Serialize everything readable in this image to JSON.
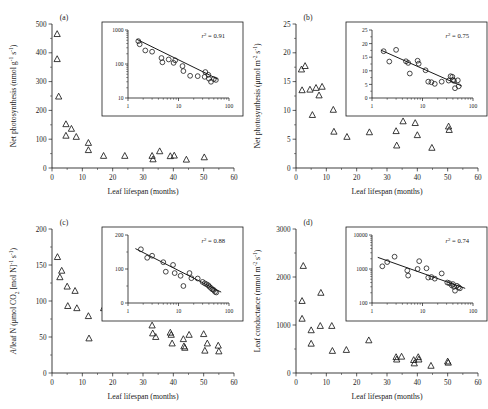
{
  "figure": {
    "shared_xlabel": "Leaf lifespan (months)",
    "xlim": [
      0,
      60
    ],
    "xticks": [
      0,
      10,
      20,
      30,
      40,
      50,
      60
    ]
  },
  "chart_data": [
    {
      "type": "scatter",
      "panel": "(a)",
      "title": "",
      "xlabel": "Leaf lifespan (months)",
      "ylabel": "Net photosynthesis (nmol g⁻¹ s⁻¹)",
      "ylabel_parts": {
        "base": "Net photosynthesis (nmol g",
        "sup1": "-1",
        "mid": " s",
        "sup2": "-1",
        "tail": ")"
      },
      "xlim": [
        0,
        60
      ],
      "ylim": [
        0,
        500
      ],
      "xticks": [
        0,
        10,
        20,
        30,
        40,
        50,
        60
      ],
      "yticks": [
        0,
        100,
        200,
        300,
        400,
        500
      ],
      "grid": false,
      "marker": "open-triangle",
      "points": [
        {
          "x": 1.7,
          "y": 465
        },
        {
          "x": 1.7,
          "y": 378
        },
        {
          "x": 2.2,
          "y": 248
        },
        {
          "x": 4.6,
          "y": 152
        },
        {
          "x": 4.6,
          "y": 112
        },
        {
          "x": 6.4,
          "y": 136
        },
        {
          "x": 8.0,
          "y": 108
        },
        {
          "x": 12.0,
          "y": 87
        },
        {
          "x": 12.0,
          "y": 62
        },
        {
          "x": 17.0,
          "y": 42
        },
        {
          "x": 24.0,
          "y": 42
        },
        {
          "x": 33.0,
          "y": 42
        },
        {
          "x": 33.3,
          "y": 30
        },
        {
          "x": 35.5,
          "y": 58
        },
        {
          "x": 39.0,
          "y": 41
        },
        {
          "x": 40.3,
          "y": 43
        },
        {
          "x": 44.3,
          "y": 29
        },
        {
          "x": 50.2,
          "y": 37
        }
      ],
      "inset": {
        "r2_label": "r² = 0.91",
        "r2_value": 0.91,
        "xscale": "log",
        "yscale": "log",
        "xlim": [
          1,
          100
        ],
        "ylim": [
          10,
          1000
        ],
        "xticks": [
          1,
          10,
          100
        ],
        "yticks": [
          10,
          100,
          1000
        ],
        "marker": "open-circle",
        "fit_line": {
          "x1": 1.5,
          "y1": 530,
          "x2": 60,
          "y2": 36
        },
        "points": [
          {
            "x": 1.6,
            "y": 470
          },
          {
            "x": 1.7,
            "y": 380
          },
          {
            "x": 2.2,
            "y": 250
          },
          {
            "x": 3.0,
            "y": 230
          },
          {
            "x": 4.6,
            "y": 150
          },
          {
            "x": 4.8,
            "y": 112
          },
          {
            "x": 6.4,
            "y": 136
          },
          {
            "x": 8.0,
            "y": 108
          },
          {
            "x": 8.6,
            "y": 128
          },
          {
            "x": 12.0,
            "y": 87
          },
          {
            "x": 12.5,
            "y": 62
          },
          {
            "x": 17.0,
            "y": 45
          },
          {
            "x": 24.0,
            "y": 44
          },
          {
            "x": 33.0,
            "y": 42
          },
          {
            "x": 34.0,
            "y": 58
          },
          {
            "x": 39.0,
            "y": 48
          },
          {
            "x": 40.0,
            "y": 37
          },
          {
            "x": 44.0,
            "y": 30
          },
          {
            "x": 50.0,
            "y": 36
          },
          {
            "x": 55.0,
            "y": 34
          }
        ]
      }
    },
    {
      "type": "scatter",
      "panel": "(b)",
      "title": "",
      "xlabel": "Leaf lifespan (months)",
      "ylabel": "Net photosynthesis (μmol m⁻² s⁻¹)",
      "ylabel_parts": {
        "base": "Net photosynthesis (μmol m",
        "sup1": "-2",
        "mid": " s",
        "sup2": "-1",
        "tail": ")"
      },
      "xlim": [
        0,
        60
      ],
      "ylim": [
        0,
        25
      ],
      "xticks": [
        0,
        10,
        20,
        30,
        40,
        50,
        60
      ],
      "yticks": [
        0,
        5,
        10,
        15,
        20,
        25
      ],
      "grid": false,
      "marker": "open-triangle",
      "points": [
        {
          "x": 1.8,
          "y": 17.1
        },
        {
          "x": 2.0,
          "y": 13.5
        },
        {
          "x": 3.0,
          "y": 17.7
        },
        {
          "x": 4.6,
          "y": 13.6
        },
        {
          "x": 5.4,
          "y": 9.2
        },
        {
          "x": 6.6,
          "y": 13.9
        },
        {
          "x": 7.6,
          "y": 12.6
        },
        {
          "x": 8.6,
          "y": 14.1
        },
        {
          "x": 12.3,
          "y": 10.1
        },
        {
          "x": 12.5,
          "y": 6.3
        },
        {
          "x": 16.8,
          "y": 5.4
        },
        {
          "x": 24.2,
          "y": 6.2
        },
        {
          "x": 33.0,
          "y": 6.4
        },
        {
          "x": 33.2,
          "y": 3.9
        },
        {
          "x": 35.3,
          "y": 8.1
        },
        {
          "x": 39.3,
          "y": 7.8
        },
        {
          "x": 40.0,
          "y": 5.7
        },
        {
          "x": 44.8,
          "y": 3.5
        },
        {
          "x": 50.3,
          "y": 7.2
        },
        {
          "x": 50.5,
          "y": 6.6
        }
      ],
      "inset": {
        "r2_label": "r² = 0.75",
        "r2_value": 0.75,
        "xscale": "log",
        "yscale": "linear",
        "xlim": [
          1,
          100
        ],
        "ylim": [
          0,
          25
        ],
        "xticks": [
          1,
          10,
          100
        ],
        "yticks": [
          0,
          5,
          10,
          15,
          20,
          25
        ],
        "marker": "open-circle",
        "fit_line": {
          "x1": 1.5,
          "y1": 17.6,
          "x2": 60,
          "y2": 4.4
        },
        "points": [
          {
            "x": 1.7,
            "y": 17.2
          },
          {
            "x": 2.2,
            "y": 13.4
          },
          {
            "x": 3.0,
            "y": 17.7
          },
          {
            "x": 4.7,
            "y": 13.5
          },
          {
            "x": 5.2,
            "y": 12.9
          },
          {
            "x": 5.6,
            "y": 9.0
          },
          {
            "x": 8.0,
            "y": 13.7
          },
          {
            "x": 8.4,
            "y": 12.6
          },
          {
            "x": 11.5,
            "y": 10.2
          },
          {
            "x": 13.0,
            "y": 6.0
          },
          {
            "x": 15.0,
            "y": 5.8
          },
          {
            "x": 17.5,
            "y": 5.2
          },
          {
            "x": 24.0,
            "y": 6.0
          },
          {
            "x": 33.0,
            "y": 6.4
          },
          {
            "x": 36.0,
            "y": 8.0
          },
          {
            "x": 39.0,
            "y": 7.8
          },
          {
            "x": 40.0,
            "y": 6.6
          },
          {
            "x": 42.0,
            "y": 6.3
          },
          {
            "x": 44.0,
            "y": 3.6
          },
          {
            "x": 50.0,
            "y": 6.5
          },
          {
            "x": 52.0,
            "y": 4.3
          }
        ]
      }
    },
    {
      "type": "scatter",
      "panel": "(c)",
      "title": "",
      "xlabel": "Leaf lifespan (months)",
      "ylabel": "A/leaf N (μmol CO₂ [mol N]⁻¹ s⁻¹)",
      "ylabel_parts": {
        "base": "A/leaf N (μmol CO",
        "sub1": "2",
        "mid": " [mol N]",
        "sup1": "-1",
        "mid2": " s",
        "sup2": "-1",
        "tail": ")"
      },
      "xlim": [
        0,
        60
      ],
      "ylim": [
        0,
        200
      ],
      "xticks": [
        0,
        10,
        20,
        30,
        40,
        50,
        60
      ],
      "yticks": [
        0,
        50,
        100,
        150,
        200
      ],
      "grid": false,
      "marker": "open-triangle",
      "points": [
        {
          "x": 1.8,
          "y": 161
        },
        {
          "x": 2.6,
          "y": 133
        },
        {
          "x": 3.2,
          "y": 142
        },
        {
          "x": 5.0,
          "y": 120
        },
        {
          "x": 5.2,
          "y": 93
        },
        {
          "x": 7.6,
          "y": 114
        },
        {
          "x": 8.2,
          "y": 90
        },
        {
          "x": 12.0,
          "y": 79
        },
        {
          "x": 12.2,
          "y": 48
        },
        {
          "x": 17.0,
          "y": 90
        },
        {
          "x": 33.0,
          "y": 66
        },
        {
          "x": 33.2,
          "y": 55
        },
        {
          "x": 34.2,
          "y": 50
        },
        {
          "x": 39.0,
          "y": 56
        },
        {
          "x": 39.3,
          "y": 53
        },
        {
          "x": 39.6,
          "y": 41
        },
        {
          "x": 43.3,
          "y": 47
        },
        {
          "x": 43.5,
          "y": 37
        },
        {
          "x": 43.8,
          "y": 35
        },
        {
          "x": 45.2,
          "y": 53
        },
        {
          "x": 50.0,
          "y": 54
        },
        {
          "x": 50.4,
          "y": 31
        },
        {
          "x": 51.2,
          "y": 41
        },
        {
          "x": 54.8,
          "y": 38
        },
        {
          "x": 55.0,
          "y": 30
        }
      ],
      "inset": {
        "r2_label": "r² = 0.88",
        "r2_value": 0.88,
        "xscale": "log",
        "yscale": "linear",
        "xlim": [
          1,
          100
        ],
        "ylim": [
          0,
          200
        ],
        "xticks": [
          1,
          10,
          100
        ],
        "yticks": [
          0,
          100,
          200
        ],
        "marker": "open-circle",
        "fit_line": {
          "x1": 1.4,
          "y1": 160,
          "x2": 70,
          "y2": 32
        },
        "points": [
          {
            "x": 1.8,
            "y": 158
          },
          {
            "x": 2.4,
            "y": 133
          },
          {
            "x": 3.0,
            "y": 139
          },
          {
            "x": 5.0,
            "y": 120
          },
          {
            "x": 5.6,
            "y": 92
          },
          {
            "x": 7.8,
            "y": 112
          },
          {
            "x": 8.4,
            "y": 88
          },
          {
            "x": 11.0,
            "y": 80
          },
          {
            "x": 12.5,
            "y": 50
          },
          {
            "x": 16.5,
            "y": 88
          },
          {
            "x": 18.0,
            "y": 73
          },
          {
            "x": 24.0,
            "y": 72
          },
          {
            "x": 30.0,
            "y": 62
          },
          {
            "x": 33.0,
            "y": 58
          },
          {
            "x": 36.0,
            "y": 55
          },
          {
            "x": 39.0,
            "y": 52
          },
          {
            "x": 41.0,
            "y": 48
          },
          {
            "x": 44.0,
            "y": 44
          },
          {
            "x": 47.0,
            "y": 40
          },
          {
            "x": 50.0,
            "y": 38
          },
          {
            "x": 53.0,
            "y": 33
          },
          {
            "x": 56.0,
            "y": 31
          }
        ]
      }
    },
    {
      "type": "scatter",
      "panel": "(d)",
      "title": "",
      "xlabel": "Leaf lifespan (months)",
      "ylabel": "Leaf conductance (mmol m⁻² s⁻¹)",
      "ylabel_parts": {
        "base": "Leaf conductance (mmol m",
        "sup1": "-2",
        "mid": " s",
        "sup2": "-1",
        "tail": ")"
      },
      "xlim": [
        0,
        60
      ],
      "ylim": [
        0,
        3000
      ],
      "xticks": [
        0,
        10,
        20,
        30,
        40,
        50,
        60
      ],
      "yticks": [
        0,
        1000,
        2000,
        3000
      ],
      "grid": false,
      "marker": "open-triangle",
      "points": [
        {
          "x": 2.4,
          "y": 2230
        },
        {
          "x": 2.0,
          "y": 1500
        },
        {
          "x": 2.0,
          "y": 1130
        },
        {
          "x": 5.0,
          "y": 890
        },
        {
          "x": 5.0,
          "y": 610
        },
        {
          "x": 8.2,
          "y": 1670
        },
        {
          "x": 8.0,
          "y": 980
        },
        {
          "x": 11.8,
          "y": 980
        },
        {
          "x": 12.0,
          "y": 460
        },
        {
          "x": 16.6,
          "y": 480
        },
        {
          "x": 24.0,
          "y": 680
        },
        {
          "x": 33.0,
          "y": 330
        },
        {
          "x": 33.2,
          "y": 280
        },
        {
          "x": 34.8,
          "y": 340
        },
        {
          "x": 38.8,
          "y": 270
        },
        {
          "x": 39.0,
          "y": 200
        },
        {
          "x": 40.3,
          "y": 330
        },
        {
          "x": 40.5,
          "y": 280
        },
        {
          "x": 44.5,
          "y": 150
        },
        {
          "x": 50.0,
          "y": 240
        },
        {
          "x": 50.2,
          "y": 215
        }
      ],
      "inset": {
        "r2_label": "r² = 0.74",
        "r2_value": 0.74,
        "xscale": "log",
        "yscale": "log",
        "xlim": [
          1,
          100
        ],
        "ylim": [
          100,
          10000
        ],
        "xticks": [
          1,
          10,
          100
        ],
        "yticks": [
          100,
          1000,
          10000
        ],
        "marker": "open-circle",
        "fit_line": {
          "x1": 1.3,
          "y1": 2200,
          "x2": 70,
          "y2": 270
        },
        "points": [
          {
            "x": 1.6,
            "y": 1200
          },
          {
            "x": 2.0,
            "y": 1600
          },
          {
            "x": 2.8,
            "y": 2300
          },
          {
            "x": 5.0,
            "y": 900
          },
          {
            "x": 5.2,
            "y": 640
          },
          {
            "x": 8.0,
            "y": 1000
          },
          {
            "x": 8.6,
            "y": 1700
          },
          {
            "x": 12.0,
            "y": 1050
          },
          {
            "x": 13.0,
            "y": 560
          },
          {
            "x": 15.0,
            "y": 580
          },
          {
            "x": 17.5,
            "y": 520
          },
          {
            "x": 24.0,
            "y": 740
          },
          {
            "x": 31.0,
            "y": 400
          },
          {
            "x": 34.0,
            "y": 380
          },
          {
            "x": 38.0,
            "y": 330
          },
          {
            "x": 40.0,
            "y": 360
          },
          {
            "x": 42.0,
            "y": 300
          },
          {
            "x": 44.0,
            "y": 230
          },
          {
            "x": 48.0,
            "y": 320
          },
          {
            "x": 52.0,
            "y": 290
          },
          {
            "x": 55.0,
            "y": 270
          }
        ]
      }
    }
  ]
}
